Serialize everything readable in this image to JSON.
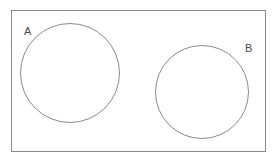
{
  "diagram": {
    "type": "venn-diagram",
    "background_color": "#ffffff",
    "stroke_color": "#8a8a8a",
    "label_color": "#4a4a4a",
    "universe": {
      "name": "universal-set-rectangle",
      "x": 11,
      "y": 10,
      "width": 255,
      "height": 142,
      "stroke": "#8a8a8a",
      "stroke_width": 1,
      "fill": "none"
    },
    "sets": [
      {
        "id": "A",
        "label": "A",
        "shape": "circle",
        "cx": 70,
        "cy": 73,
        "r": 50,
        "stroke": "#8a8a8a",
        "stroke_width": 1,
        "fill": "none",
        "label_x": 24,
        "label_y": 26
      },
      {
        "id": "B",
        "label": "B",
        "shape": "circle",
        "cx": 202,
        "cy": 92,
        "r": 47,
        "stroke": "#8a8a8a",
        "stroke_width": 1,
        "fill": "none",
        "label_x": 245,
        "label_y": 43
      }
    ],
    "relationship": "disjoint"
  }
}
